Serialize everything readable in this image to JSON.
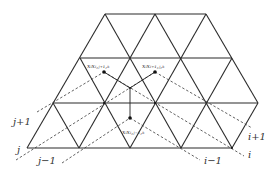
{
  "diagram": {
    "type": "triangular-lattice",
    "rows": [
      {
        "y": 14,
        "x": [
          105,
          155,
          206
        ]
      },
      {
        "y": 58,
        "x": [
          80,
          130,
          181,
          232
        ]
      },
      {
        "y": 103,
        "x": [
          53,
          104,
          155,
          207,
          258
        ]
      },
      {
        "y": 148,
        "x": [
          27,
          79,
          130,
          181,
          232
        ]
      }
    ],
    "nodes": [
      {
        "id": "upper-left",
        "label": "x_i x_{i,j+1,k}",
        "display": "xᵢxᵢ,ⱼ₊₁,ₖ",
        "x": 104,
        "y": 72
      },
      {
        "id": "upper-right",
        "label": "x_i x_{i+1,j,k}",
        "display": "xᵢxᵢ₊₁,ⱼ,ₖ",
        "x": 155,
        "y": 72
      },
      {
        "id": "lower",
        "label": "x_i x_{i,j-1,k}",
        "display": "xᵢxᵢ,ⱼ₋₁,ₖ",
        "x": 130,
        "y": 118
      }
    ],
    "junction": {
      "x": 130,
      "y": 88
    },
    "axis_labels": {
      "j_plus_1": "j+1",
      "j": "j",
      "j_minus_1": "j−1",
      "i_plus_1": "i+1",
      "i": "i",
      "i_minus_1": "i−1"
    },
    "colors": {
      "line": "#2b2b2b",
      "background": "#ffffff"
    }
  }
}
